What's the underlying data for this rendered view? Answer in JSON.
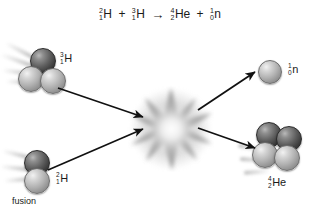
{
  "figure": {
    "caption": "fusion",
    "background_color": "#ffffff",
    "text_color": "#1a1a1a"
  },
  "equation": {
    "reactant_1": {
      "mass_number": "2",
      "atomic_number": "1",
      "symbol": "H"
    },
    "plus_1": "+",
    "reactant_2": {
      "mass_number": "3",
      "atomic_number": "1",
      "symbol": "H"
    },
    "arrow": "→",
    "product_1": {
      "mass_number": "4",
      "atomic_number": "2",
      "symbol": "He"
    },
    "plus_2": "+",
    "product_2": {
      "mass_number": "1",
      "atomic_number": "0",
      "symbol": "n"
    }
  },
  "particles": {
    "tritium": {
      "label": {
        "mass_number": "3",
        "atomic_number": "1",
        "symbol": "H"
      },
      "nucleon_count": 3,
      "role": "reactant"
    },
    "deuterium": {
      "label": {
        "mass_number": "2",
        "atomic_number": "1",
        "symbol": "H"
      },
      "nucleon_count": 2,
      "role": "reactant"
    },
    "neutron": {
      "label": {
        "mass_number": "1",
        "atomic_number": "0",
        "symbol": "n"
      },
      "nucleon_count": 1,
      "role": "product"
    },
    "helium": {
      "label": {
        "mass_number": "4",
        "atomic_number": "2",
        "symbol": "He"
      },
      "nucleon_count": 4,
      "role": "product"
    }
  },
  "burst": {
    "name": "fusion-burst",
    "points": 9,
    "color": "#8a8a8a"
  },
  "colors": {
    "proton_dark": "#3a3a3a",
    "neutron_light": "#b2b2b2",
    "arrow": "#111111",
    "streak": "#787878"
  }
}
